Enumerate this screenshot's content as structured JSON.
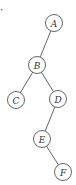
{
  "diagram": {
    "type": "binary-tree",
    "marker": "·",
    "nodes": [
      {
        "id": "A",
        "label": "A",
        "x": 54,
        "y": 23
      },
      {
        "id": "B",
        "label": "B",
        "x": 37,
        "y": 65
      },
      {
        "id": "C",
        "label": "C",
        "x": 16,
        "y": 100
      },
      {
        "id": "D",
        "label": "D",
        "x": 58,
        "y": 99
      },
      {
        "id": "E",
        "label": "E",
        "x": 42,
        "y": 139
      },
      {
        "id": "F",
        "label": "F",
        "x": 63,
        "y": 172
      }
    ],
    "edges": [
      {
        "from": "A",
        "to": "B"
      },
      {
        "from": "B",
        "to": "C"
      },
      {
        "from": "B",
        "to": "D"
      },
      {
        "from": "D",
        "to": "E"
      },
      {
        "from": "E",
        "to": "F"
      }
    ],
    "colors": {
      "stroke": "#555555",
      "text": "#333333",
      "background": "#ffffff"
    }
  }
}
